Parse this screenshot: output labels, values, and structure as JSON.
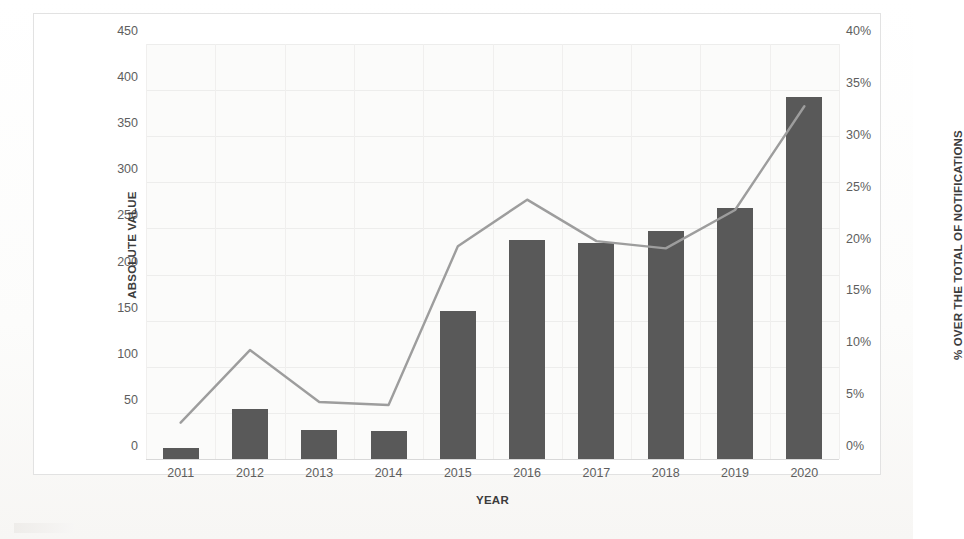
{
  "chart_data": {
    "type": "bar",
    "title": "",
    "subtitle": "",
    "xlabel": "YEAR",
    "ylabel": "ABSOLUTE VALUE",
    "y2label": "% OVER THE TOTAL OF NOTIFICATIONS",
    "categories": [
      "2011",
      "2012",
      "2013",
      "2014",
      "2015",
      "2016",
      "2017",
      "2018",
      "2019",
      "2020"
    ],
    "ylim": [
      0,
      450
    ],
    "y2lim": [
      0,
      40
    ],
    "yticks": [
      "450",
      "400",
      "350",
      "300",
      "250",
      "200",
      "150",
      "100",
      "50",
      "0"
    ],
    "ytick_values": [
      450,
      400,
      350,
      300,
      250,
      200,
      150,
      100,
      50,
      0
    ],
    "y2ticks": [
      "40%",
      "35%",
      "30%",
      "25%",
      "20%",
      "15%",
      "10%",
      "5%",
      "0%"
    ],
    "y2tick_values": [
      40,
      35,
      30,
      25,
      20,
      15,
      10,
      5,
      0
    ],
    "grid": true,
    "legend": "none",
    "series": [
      {
        "name": "Absolute value",
        "type": "bar",
        "axis": "left",
        "color": "#595959",
        "values": [
          12,
          54,
          32,
          30,
          161,
          238,
          234,
          247,
          272,
          393
        ]
      },
      {
        "name": "% over the total of notifications",
        "type": "line",
        "axis": "right",
        "color": "#9d9d9d",
        "values": [
          3.5,
          10.5,
          5.5,
          5.2,
          20.5,
          25.0,
          21.0,
          20.3,
          24.0,
          34.0
        ]
      }
    ]
  },
  "axes": {
    "left_title": "ABSOLUTE VALUE",
    "right_title": "% OVER THE TOTAL OF NOTIFICATIONS",
    "x_title": "YEAR"
  },
  "style": {
    "bar_color": "#595959",
    "line_color": "#9d9d9d",
    "plot_background": "#fbfbfa",
    "frame_border": "#e2e2e2",
    "tick_text": "#5e5e5e",
    "axis_title_text": "#3c3c3c"
  }
}
